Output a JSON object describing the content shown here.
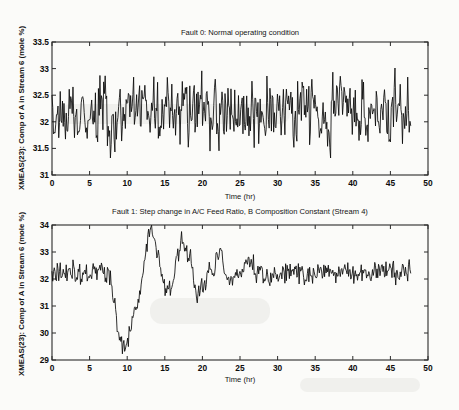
{
  "figure": {
    "kind": "matlab-two-subplot-timeseries",
    "background_color": "#fbfbf9",
    "line_color": "#0a0a0a",
    "axis_color": "#2a2a2a"
  },
  "chart_data": [
    {
      "type": "line",
      "title": "Fault 0: Normal operating condition",
      "xlabel": "Time (hr)",
      "ylabel": "XMEAS(23): Comp of A in Stream 6 (mole %)",
      "xlim": [
        0,
        50
      ],
      "ylim": [
        31,
        33.5
      ],
      "xticks": [
        0,
        5,
        10,
        15,
        20,
        25,
        30,
        35,
        40,
        45,
        50
      ],
      "xticklabels": [
        "0",
        "5",
        "10",
        "15",
        "20",
        "25",
        "30",
        "35",
        "40",
        "45",
        "50"
      ],
      "yticks": [
        31,
        31.5,
        32,
        32.5,
        33,
        33.5
      ],
      "yticklabels": [
        "31",
        "31.5",
        "32",
        "32.5",
        "33",
        "33.5"
      ],
      "grid": false,
      "legend": null,
      "series": [
        {
          "name": "XMEAS(23) normal",
          "x_start": 0,
          "x_end": 47.7,
          "n_points": 480,
          "mean": 32.18,
          "noise_sd": 0.29,
          "min": 31.32,
          "max": 33.02,
          "seed": 20231,
          "baseline_segments": [
            {
              "t": 0,
              "value": 32.2
            },
            {
              "t": 2,
              "value": 32.1
            },
            {
              "t": 4,
              "value": 32.15
            },
            {
              "t": 6,
              "value": 32.25
            },
            {
              "t": 8,
              "value": 32.1
            },
            {
              "t": 10,
              "value": 32.15
            },
            {
              "t": 12,
              "value": 32.42
            },
            {
              "t": 14,
              "value": 32.15
            },
            {
              "t": 16,
              "value": 32.12
            },
            {
              "t": 18,
              "value": 32.2
            },
            {
              "t": 20,
              "value": 32.25
            },
            {
              "t": 22,
              "value": 32.15
            },
            {
              "t": 24,
              "value": 32.2
            },
            {
              "t": 26,
              "value": 32.25
            },
            {
              "t": 28,
              "value": 32.1
            },
            {
              "t": 30,
              "value": 32.3
            },
            {
              "t": 32,
              "value": 32.18
            },
            {
              "t": 34,
              "value": 32.2
            },
            {
              "t": 36,
              "value": 32.0
            },
            {
              "t": 38,
              "value": 32.38
            },
            {
              "t": 40,
              "value": 32.2
            },
            {
              "t": 42,
              "value": 32.1
            },
            {
              "t": 44,
              "value": 32.2
            },
            {
              "t": 46,
              "value": 32.3
            },
            {
              "t": 47.7,
              "value": 32.15
            }
          ]
        }
      ]
    },
    {
      "type": "line",
      "title": "Fault 1: Step change in A/C Feed Ratio, B Composition Constant (Stream 4)",
      "xlabel": "Time (hr)",
      "ylabel": "XMEAS(23): Comp of A in Stream 6 (mole %)",
      "xlim": [
        0,
        50
      ],
      "ylim": [
        29,
        34
      ],
      "xticks": [
        0,
        5,
        10,
        15,
        20,
        25,
        30,
        35,
        40,
        45,
        50
      ],
      "xticklabels": [
        "0",
        "5",
        "10",
        "15",
        "20",
        "25",
        "30",
        "35",
        "40",
        "45",
        "50"
      ],
      "yticks": [
        29,
        30,
        31,
        32,
        33,
        34
      ],
      "yticklabels": [
        "29",
        "30",
        "31",
        "32",
        "33",
        "34"
      ],
      "grid": false,
      "legend": null,
      "fault_introduced_hr": 8,
      "series": [
        {
          "name": "XMEAS(23) fault 1",
          "x_start": 0,
          "x_end": 47.7,
          "n_points": 480,
          "noise_sd": 0.19,
          "min": 29.2,
          "max": 34.0,
          "seed": 77311,
          "baseline_segments": [
            {
              "t": 0,
              "value": 32.15
            },
            {
              "t": 2,
              "value": 32.3
            },
            {
              "t": 4,
              "value": 32.2
            },
            {
              "t": 6,
              "value": 32.3
            },
            {
              "t": 7.5,
              "value": 32.3
            },
            {
              "t": 8.1,
              "value": 31.6
            },
            {
              "t": 8.6,
              "value": 30.4
            },
            {
              "t": 9.1,
              "value": 29.45
            },
            {
              "t": 9.6,
              "value": 29.3
            },
            {
              "t": 10.1,
              "value": 29.75
            },
            {
              "t": 10.8,
              "value": 30.5
            },
            {
              "t": 11.5,
              "value": 31.1
            },
            {
              "t": 12.2,
              "value": 32.4
            },
            {
              "t": 12.8,
              "value": 33.5
            },
            {
              "t": 13.2,
              "value": 33.95
            },
            {
              "t": 13.8,
              "value": 33.4
            },
            {
              "t": 14.4,
              "value": 32.4
            },
            {
              "t": 15.0,
              "value": 31.5
            },
            {
              "t": 15.6,
              "value": 31.6
            },
            {
              "t": 16.2,
              "value": 32.1
            },
            {
              "t": 16.8,
              "value": 32.9
            },
            {
              "t": 17.2,
              "value": 33.5
            },
            {
              "t": 17.8,
              "value": 32.9
            },
            {
              "t": 18.4,
              "value": 32.9
            },
            {
              "t": 19.0,
              "value": 31.6
            },
            {
              "t": 19.6,
              "value": 31.4
            },
            {
              "t": 20.4,
              "value": 32.0
            },
            {
              "t": 21.2,
              "value": 32.3
            },
            {
              "t": 22.2,
              "value": 33.0
            },
            {
              "t": 23.0,
              "value": 32.3
            },
            {
              "t": 23.8,
              "value": 31.8
            },
            {
              "t": 24.6,
              "value": 32.2
            },
            {
              "t": 25.4,
              "value": 32.5
            },
            {
              "t": 26.4,
              "value": 32.8
            },
            {
              "t": 27.2,
              "value": 32.2
            },
            {
              "t": 28.5,
              "value": 32.3
            },
            {
              "t": 30.0,
              "value": 32.2
            },
            {
              "t": 32.0,
              "value": 32.3
            },
            {
              "t": 34.0,
              "value": 32.2
            },
            {
              "t": 36.0,
              "value": 32.3
            },
            {
              "t": 38.0,
              "value": 32.2
            },
            {
              "t": 40.0,
              "value": 32.3
            },
            {
              "t": 42.0,
              "value": 32.2
            },
            {
              "t": 44.0,
              "value": 32.4
            },
            {
              "t": 46.0,
              "value": 32.1
            },
            {
              "t": 47.0,
              "value": 32.4
            },
            {
              "t": 47.7,
              "value": 32.3
            }
          ]
        }
      ]
    }
  ]
}
